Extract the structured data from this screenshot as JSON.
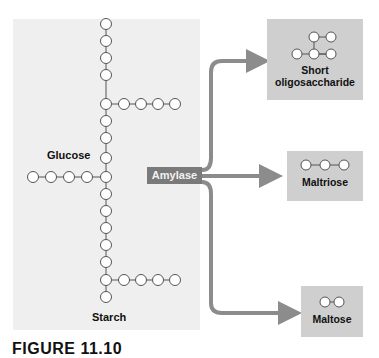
{
  "figure": {
    "starch_label": "Starch",
    "glucose_label": "Glucose",
    "enzyme_label": "Amylase",
    "products": [
      {
        "label_line1": "Short",
        "label_line2": "oligosaccharide",
        "units": 4,
        "branched": true
      },
      {
        "label_line1": "Maltriose",
        "units": 3,
        "branched": false
      },
      {
        "label_line1": "Maltose",
        "units": 2,
        "branched": false
      }
    ],
    "caption": "FIGURE 11.10"
  },
  "colors": {
    "panel": "#efefef",
    "arrow": "#8c8c8c",
    "enzyme_bg": "#7a7a7a",
    "product_bg": "#cfcfcf",
    "node_stroke": "#555555"
  }
}
